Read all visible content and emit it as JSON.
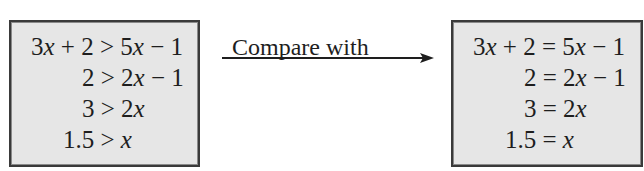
{
  "left_box": {
    "lines": [
      "3x + 2 > 5x − 1",
      "2 > 2x − 1",
      "3 > 2x",
      "1.5 > x"
    ]
  },
  "connector": {
    "label": "Compare with",
    "arrow_direction": "right"
  },
  "right_box": {
    "lines": [
      "3x + 2 = 5x − 1",
      "2 = 2x − 1",
      "3 = 2x",
      "1.5 = x"
    ]
  },
  "colors": {
    "box_fill": "#e6e6e6",
    "border": "#3a3a3a",
    "text": "#1e1e1e"
  }
}
